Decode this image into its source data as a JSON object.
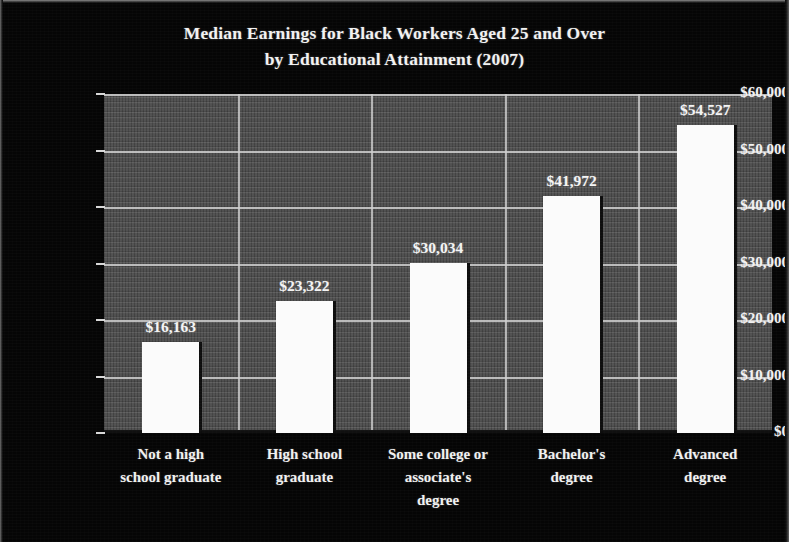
{
  "chart_data": {
    "type": "bar",
    "title": "Median Earnings for Black Workers Aged 25 and Over by Educational Attainment (2007)",
    "title_line1": "Median Earnings for Black Workers Aged 25 and Over",
    "title_line2": "by Educational Attainment (2007)",
    "xlabel": "",
    "ylabel": "",
    "ylim": [
      0,
      60000
    ],
    "grid": true,
    "legend": false,
    "categories": [
      "Not a high school graduate",
      "High school graduate",
      "Some college or associate's degree",
      "Bachelor's degree",
      "Advanced degree"
    ],
    "category_lines": [
      [
        "Not a high",
        "school graduate"
      ],
      [
        "High school",
        "graduate"
      ],
      [
        "Some college or",
        "associate's",
        "degree"
      ],
      [
        "Bachelor's",
        "degree"
      ],
      [
        "Advanced",
        "degree"
      ]
    ],
    "values": [
      16163,
      23322,
      30034,
      41972,
      54527
    ],
    "value_labels": [
      "$16,163",
      "$23,322",
      "$30,034",
      "$41,972",
      "$54,527"
    ],
    "ytick_values": [
      0,
      10000,
      20000,
      30000,
      40000,
      50000,
      60000
    ],
    "ytick_labels": [
      "$0",
      "$10,000",
      "$20,000",
      "$30,000",
      "$40,000",
      "$50,000",
      "$60,000"
    ],
    "colors": {
      "background": "#050505",
      "plot_area": "#4a4a4a",
      "bar": "#fbfbfb",
      "gridline": "#cfcfcf",
      "text": "#f2f2f2"
    }
  }
}
